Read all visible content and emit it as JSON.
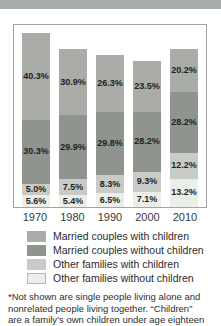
{
  "page": {
    "top_band_color": "#a8ada9"
  },
  "chart_data": {
    "type": "bar",
    "stacked": true,
    "title": "",
    "xlabel": "",
    "ylabel": "",
    "grid": false,
    "legend_position": "bottom",
    "value_suffix": "%",
    "ylim": [
      0,
      85
    ],
    "categories": [
      "1970",
      "1980",
      "1990",
      "2000",
      "2010"
    ],
    "series": [
      {
        "name": "Married couples with children",
        "color": "#a9aca7",
        "values": [
          40.3,
          30.9,
          26.3,
          23.5,
          20.2
        ]
      },
      {
        "name": "Married couples without children",
        "color": "#8f948e",
        "values": [
          30.3,
          29.9,
          29.8,
          28.2,
          28.2
        ]
      },
      {
        "name": "Other families with children",
        "color": "#c9ccc6",
        "values": [
          5.0,
          7.5,
          8.3,
          9.3,
          12.2
        ]
      },
      {
        "name": "Other families without children",
        "color": "#eceee9",
        "values": [
          5.6,
          5.4,
          6.5,
          7.1,
          13.2
        ]
      }
    ]
  },
  "footnote": {
    "lines": [
      "*Not shown are single people living alone and",
      "nonrelated people living together. “Children”",
      "are a family’s own children under age eighteen"
    ]
  }
}
